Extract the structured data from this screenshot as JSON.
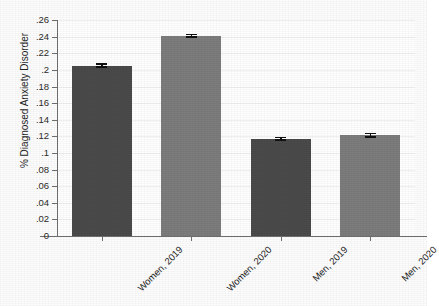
{
  "chart_data": {
    "type": "bar",
    "title": "",
    "subtitle": "",
    "xlabel": "",
    "ylabel": "% Diagnosed Anxiety Disorder",
    "categories": [
      "Women, 2019",
      "Women, 2020",
      "Men, 2019",
      "Men, 2020"
    ],
    "values": [
      0.205,
      0.241,
      0.117,
      0.1215
    ],
    "errors_low": [
      0.2025,
      0.2385,
      0.1145,
      0.1185
    ],
    "errors_high": [
      0.2085,
      0.2435,
      0.1195,
      0.1245
    ],
    "series": [
      {
        "name": "Diagnosed Anxiety Disorder",
        "values": [
          0.205,
          0.241,
          0.117,
          0.1215
        ]
      }
    ],
    "bar_colors": [
      "#4a4a4a",
      "#7c7c7c",
      "#4a4a4a",
      "#7c7c7c"
    ],
    "ylim": [
      0,
      0.26
    ],
    "yticks": [
      0,
      0.02,
      0.04,
      0.06,
      0.08,
      0.1,
      0.12,
      0.14,
      0.16,
      0.18,
      0.2,
      0.22,
      0.24,
      0.26
    ],
    "ytick_labels": [
      "0",
      ".02",
      ".04",
      ".06",
      ".08",
      ".1",
      ".12",
      ".14",
      ".16",
      ".18",
      ".2",
      ".22",
      ".24",
      ".26"
    ],
    "grid": "horizontal",
    "legend": "none",
    "error_bar_style": "capped",
    "xtick_label_rotation": -45
  },
  "colors": {
    "background": "#ffffff",
    "axis": "#6f6f6f",
    "gridline": "#f1f1f1",
    "text": "#1f1f1f",
    "error_bar": "#111111",
    "bar_2019": "#4a4a4a",
    "bar_2020": "#7c7c7c"
  }
}
